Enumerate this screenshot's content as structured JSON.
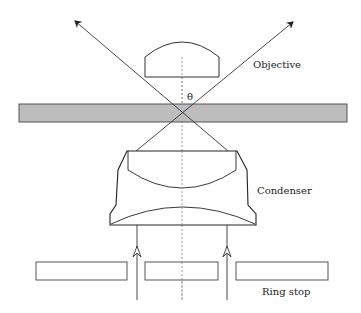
{
  "diagram": {
    "labels": {
      "objective": "Objective",
      "condenser": "Condenser",
      "ring_stop": "Ring stop",
      "angle": "θ"
    },
    "colors": {
      "stroke": "#333333",
      "slide_fill": "#bdbdbd",
      "axis": "#888888"
    },
    "components": [
      {
        "name": "objective-lens",
        "type": "plano-convex lens"
      },
      {
        "name": "specimen-slide",
        "type": "slide"
      },
      {
        "name": "condenser",
        "type": "condenser lens assembly"
      },
      {
        "name": "ring-stop",
        "type": "annular aperture",
        "segments": 3
      }
    ],
    "rays": [
      {
        "name": "left-ray",
        "direction": "up",
        "exits": "upper-left"
      },
      {
        "name": "right-ray",
        "direction": "up",
        "exits": "upper-right"
      }
    ]
  }
}
